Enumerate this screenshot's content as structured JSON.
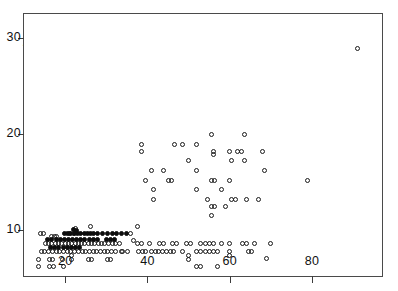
{
  "figure": {
    "name": "scatter-plot-nuclear-size-vs-absorption",
    "background_color": "#ffffff",
    "frame_color": "#4a4a4a"
  },
  "chart_data": {
    "type": "scatter",
    "title": "",
    "xlabel": "Nuclear  Size",
    "ylabel_line1": "Relative  Absorption (5500 Å)",
    "ylabel_line2": "Feulgen",
    "xlim": [
      10,
      97
    ],
    "ylim": [
      5.2,
      32.5
    ],
    "xticks": [
      20,
      40,
      60,
      80
    ],
    "xtick_labels": [
      "20",
      "40",
      "60",
      "80"
    ],
    "yticks": [
      10,
      20,
      30
    ],
    "ytick_labels": [
      "10",
      "20",
      "30"
    ],
    "grid": false,
    "legend": null,
    "marker_styles": {
      "open": "open circle",
      "filled": "filled circle"
    },
    "series": [
      {
        "name": "open circles",
        "marker": "open",
        "points": [
          [
            14.0,
            9.6
          ],
          [
            14.8,
            9.6
          ],
          [
            16.6,
            9.3
          ],
          [
            17.3,
            9.3
          ],
          [
            18.0,
            9.3
          ],
          [
            15.2,
            8.6
          ],
          [
            16.0,
            8.6
          ],
          [
            16.8,
            8.6
          ],
          [
            17.6,
            8.6
          ],
          [
            18.4,
            8.6
          ],
          [
            19.2,
            8.6
          ],
          [
            20.0,
            8.6
          ],
          [
            20.8,
            8.6
          ],
          [
            21.6,
            8.6
          ],
          [
            22.4,
            8.6
          ],
          [
            23.2,
            8.6
          ],
          [
            24.0,
            8.6
          ],
          [
            24.8,
            8.6
          ],
          [
            25.6,
            8.6
          ],
          [
            26.4,
            8.6
          ],
          [
            27.2,
            8.6
          ],
          [
            28.0,
            8.6
          ],
          [
            28.8,
            8.6
          ],
          [
            29.6,
            8.6
          ],
          [
            30.5,
            8.6
          ],
          [
            31.4,
            8.6
          ],
          [
            32.3,
            8.6
          ],
          [
            33.2,
            8.6
          ],
          [
            14.3,
            7.8
          ],
          [
            15.1,
            7.8
          ],
          [
            16.0,
            7.8
          ],
          [
            16.9,
            7.8
          ],
          [
            17.8,
            7.8
          ],
          [
            18.7,
            7.8
          ],
          [
            19.6,
            7.8
          ],
          [
            20.5,
            7.8
          ],
          [
            21.4,
            7.8
          ],
          [
            22.3,
            7.8
          ],
          [
            23.2,
            7.8
          ],
          [
            24.1,
            7.8
          ],
          [
            25.0,
            7.8
          ],
          [
            25.9,
            7.8
          ],
          [
            26.8,
            7.8
          ],
          [
            27.7,
            7.8
          ],
          [
            28.6,
            7.8
          ],
          [
            29.5,
            7.8
          ],
          [
            30.4,
            7.8
          ],
          [
            31.3,
            7.8
          ],
          [
            32.2,
            7.8
          ],
          [
            34.0,
            7.8
          ],
          [
            35.2,
            7.8
          ],
          [
            13.5,
            6.9
          ],
          [
            16.2,
            6.9
          ],
          [
            17.0,
            6.9
          ],
          [
            19.4,
            6.9
          ],
          [
            21.6,
            6.9
          ],
          [
            21.6,
            7.3
          ],
          [
            25.7,
            6.9
          ],
          [
            26.5,
            6.9
          ],
          [
            30.3,
            6.9
          ],
          [
            31.1,
            6.9
          ],
          [
            13.5,
            6.2
          ],
          [
            16.2,
            6.2
          ],
          [
            17.1,
            6.2
          ],
          [
            19.5,
            6.2
          ],
          [
            22.5,
            10.1
          ],
          [
            26.2,
            10.4
          ],
          [
            37.5,
            10.4
          ],
          [
            21.0,
            9.6
          ],
          [
            22.0,
            9.6
          ],
          [
            36.0,
            9.6
          ],
          [
            36.5,
            8.9
          ],
          [
            37.6,
            8.6
          ],
          [
            38.5,
            8.6
          ],
          [
            33.6,
            7.8
          ],
          [
            37.8,
            7.8
          ],
          [
            38.7,
            7.8
          ],
          [
            39.6,
            7.8
          ],
          [
            40.5,
            8.6
          ],
          [
            43.0,
            8.6
          ],
          [
            43.8,
            8.6
          ],
          [
            46.0,
            8.6
          ],
          [
            47.0,
            8.6
          ],
          [
            41.0,
            7.8
          ],
          [
            41.9,
            7.8
          ],
          [
            42.8,
            7.8
          ],
          [
            43.7,
            7.8
          ],
          [
            44.6,
            7.8
          ],
          [
            45.5,
            7.8
          ],
          [
            46.4,
            7.8
          ],
          [
            49.5,
            8.6
          ],
          [
            50.5,
            8.6
          ],
          [
            53.0,
            8.6
          ],
          [
            54.0,
            8.6
          ],
          [
            55.0,
            8.6
          ],
          [
            56.0,
            8.6
          ],
          [
            58.0,
            8.6
          ],
          [
            48.5,
            7.8
          ],
          [
            52.0,
            7.8
          ],
          [
            53.0,
            7.8
          ],
          [
            54.0,
            7.8
          ],
          [
            55.0,
            7.8
          ],
          [
            56.0,
            7.8
          ],
          [
            57.0,
            7.8
          ],
          [
            50.0,
            7.3
          ],
          [
            50.0,
            6.9
          ],
          [
            52.0,
            6.2
          ],
          [
            53.0,
            6.2
          ],
          [
            57.0,
            6.2
          ],
          [
            60.0,
            8.6
          ],
          [
            63.0,
            8.6
          ],
          [
            64.0,
            8.6
          ],
          [
            66.0,
            8.6
          ],
          [
            70.0,
            8.6
          ],
          [
            60.0,
            7.8
          ],
          [
            60.0,
            7.3
          ],
          [
            64.5,
            7.8
          ],
          [
            65.4,
            7.8
          ],
          [
            69.0,
            7.0
          ],
          [
            38.5,
            18.9
          ],
          [
            38.5,
            18.2
          ],
          [
            46.5,
            18.9
          ],
          [
            48.5,
            18.9
          ],
          [
            52.0,
            18.9
          ],
          [
            55.5,
            19.9
          ],
          [
            63.5,
            19.9
          ],
          [
            56.0,
            18.2
          ],
          [
            56.0,
            17.9
          ],
          [
            60.0,
            18.2
          ],
          [
            62.0,
            18.2
          ],
          [
            62.9,
            18.2
          ],
          [
            68.0,
            18.2
          ],
          [
            50.0,
            17.2
          ],
          [
            60.5,
            17.2
          ],
          [
            63.5,
            17.2
          ],
          [
            41.0,
            16.2
          ],
          [
            44.0,
            16.2
          ],
          [
            52.0,
            16.2
          ],
          [
            68.5,
            16.2
          ],
          [
            39.5,
            15.2
          ],
          [
            45.0,
            15.2
          ],
          [
            45.9,
            15.2
          ],
          [
            55.5,
            15.2
          ],
          [
            56.4,
            15.2
          ],
          [
            60.0,
            15.2
          ],
          [
            79.0,
            15.2
          ],
          [
            41.5,
            14.2
          ],
          [
            52.0,
            14.2
          ],
          [
            58.0,
            14.2
          ],
          [
            41.5,
            13.2
          ],
          [
            54.5,
            13.2
          ],
          [
            60.5,
            13.2
          ],
          [
            61.4,
            13.2
          ],
          [
            64.0,
            13.2
          ],
          [
            67.0,
            13.2
          ],
          [
            55.5,
            12.4
          ],
          [
            56.4,
            12.4
          ],
          [
            59.0,
            12.4
          ],
          [
            55.5,
            11.5
          ],
          [
            91.0,
            28.9
          ]
        ]
      },
      {
        "name": "filled circles",
        "marker": "filled",
        "points": [
          [
            19.8,
            9.6
          ],
          [
            20.6,
            9.6
          ],
          [
            21.4,
            9.6
          ],
          [
            22.2,
            9.6
          ],
          [
            23.0,
            9.6
          ],
          [
            23.8,
            9.6
          ],
          [
            24.6,
            9.6
          ],
          [
            25.4,
            9.6
          ],
          [
            26.2,
            9.6
          ],
          [
            27.0,
            9.6
          ],
          [
            27.8,
            9.6
          ],
          [
            29.0,
            9.6
          ],
          [
            30.2,
            9.6
          ],
          [
            31.4,
            9.6
          ],
          [
            32.6,
            9.6
          ],
          [
            33.8,
            9.6
          ],
          [
            35.0,
            9.6
          ],
          [
            15.8,
            9.0
          ],
          [
            16.8,
            9.0
          ],
          [
            17.8,
            9.0
          ],
          [
            18.8,
            9.0
          ],
          [
            19.8,
            9.0
          ],
          [
            20.8,
            9.0
          ],
          [
            21.8,
            9.0
          ],
          [
            22.8,
            9.0
          ],
          [
            23.8,
            9.0
          ],
          [
            24.8,
            9.0
          ],
          [
            25.8,
            9.0
          ],
          [
            26.8,
            9.0
          ],
          [
            27.8,
            9.0
          ],
          [
            16.5,
            8.2
          ],
          [
            17.5,
            8.2
          ],
          [
            18.5,
            8.2
          ],
          [
            19.5,
            8.2
          ],
          [
            20.5,
            8.2
          ],
          [
            21.5,
            8.2
          ],
          [
            22.5,
            8.2
          ],
          [
            23.5,
            8.2
          ],
          [
            22.0,
            10.0
          ],
          [
            22.8,
            9.9
          ],
          [
            30.0,
            9.0
          ],
          [
            31.0,
            9.0
          ],
          [
            32.0,
            9.0
          ]
        ]
      }
    ]
  }
}
